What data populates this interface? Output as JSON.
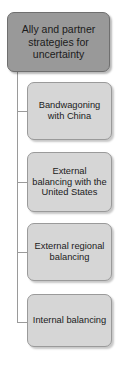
{
  "diagram": {
    "type": "hierarchy-tree",
    "orientation": "vertical-left-trunk",
    "canvas": {
      "width": 124,
      "height": 369,
      "background": "#ffffff"
    },
    "root": {
      "id": "root",
      "label": "Ally and partner strategies for uncertainty",
      "fill": "#999999",
      "border": "#6f6f6f"
    },
    "children": [
      {
        "id": "child-1",
        "label": "Bandwagoning with China",
        "fill": "#d6d6d6",
        "border": "#9a9a9a"
      },
      {
        "id": "child-2",
        "label": "External balancing with the United States",
        "fill": "#d6d6d6",
        "border": "#9a9a9a"
      },
      {
        "id": "child-3",
        "label": "External regional balancing",
        "fill": "#d6d6d6",
        "border": "#9a9a9a"
      },
      {
        "id": "child-4",
        "label": "Internal balancing",
        "fill": "#d6d6d6",
        "border": "#9a9a9a"
      }
    ],
    "connector_color": "#9a9a9a"
  }
}
